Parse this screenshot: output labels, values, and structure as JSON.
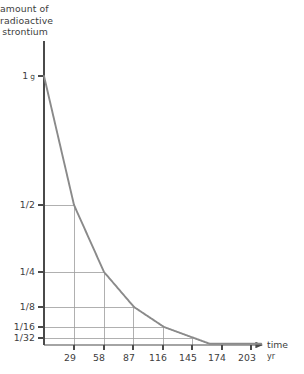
{
  "chart_data": {
    "type": "line",
    "title": "amount of radioactive strontium",
    "title_lines": [
      "amount of",
      "radioactive",
      "strontium"
    ],
    "xlabel": "time",
    "xunit": "yr",
    "ylabel": "amount of radioactive strontium",
    "x_tick_labels": [
      "29",
      "58",
      "87",
      "116",
      "145",
      "174",
      "203"
    ],
    "x_tick_values": [
      29,
      58,
      87,
      116,
      145,
      174,
      203
    ],
    "y_tick_labels": [
      "1 g",
      "1/2",
      "1/4",
      "1/8",
      "1/16",
      "1/32"
    ],
    "y_first_tick_number": "1",
    "y_first_tick_unit": "g",
    "y_tick_values": [
      1,
      0.5,
      0.25,
      0.125,
      0.0625,
      0.03125
    ],
    "xlim": [
      0,
      210
    ],
    "ylim": [
      0,
      1
    ],
    "y_scale": "log2-ish compressed",
    "grid": "stepped half-life guide lines",
    "series": [
      {
        "name": "radioactive strontium decay",
        "half_life": 29,
        "x": [
          0,
          29,
          58,
          87,
          116,
          145,
          174,
          203
        ],
        "values": [
          1,
          0.5,
          0.25,
          0.125,
          0.0625,
          0.03125,
          0.015625,
          0.0078125
        ]
      }
    ],
    "curve_color": "#8a8a8a",
    "axis_color": "#4a4a4a",
    "grid_color": "#9c9c9c",
    "legend": "none",
    "annotations": []
  },
  "axis": {
    "arrow_label": "time",
    "arrow_unit": "yr"
  }
}
